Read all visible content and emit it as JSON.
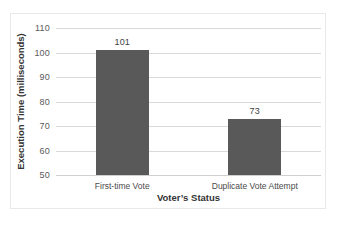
{
  "chart_data": {
    "type": "bar",
    "title": "",
    "categories": [
      "First-time Vote",
      "Duplicate Vote Attempt"
    ],
    "values": [
      101,
      73
    ],
    "data_labels": [
      "101",
      "73"
    ],
    "xlabel": "Voter’s Status",
    "ylabel": "Execution Time (milliseconds)",
    "ylim": [
      50,
      110
    ],
    "ytick_step": 10,
    "yticks": [
      "110",
      "100",
      "90",
      "80",
      "70",
      "60",
      "50"
    ],
    "ytick_values": [
      110,
      100,
      90,
      80,
      70,
      60,
      50
    ],
    "grid": "horizontal",
    "legend": "none",
    "bar_color": "#595959",
    "gridline_color": "#d9d9d9",
    "frame_color": "#e8e8e8",
    "text_color": "#333333",
    "background": "#ffffff"
  }
}
